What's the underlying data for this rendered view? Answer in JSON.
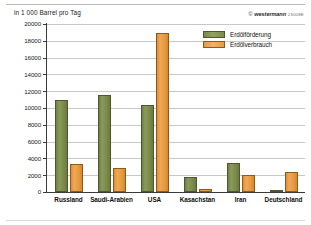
{
  "chart_data": {
    "type": "bar",
    "title": "in 1 000 Barrel pro Tag",
    "xlabel": "",
    "ylabel": "in 1 000 Barrel pro Tag",
    "ylim": [
      0,
      20000
    ],
    "ytick_step": 2000,
    "grid": true,
    "legend_position": "top-right",
    "categories": [
      "Russland",
      "Saudi-Arabien",
      "USA",
      "Kasachstan",
      "Iran",
      "Deutschland"
    ],
    "series": [
      {
        "name": "Erdölförderung",
        "color": "#7b8a4a",
        "values": [
          10900,
          11600,
          10300,
          1800,
          3500,
          150
        ]
      },
      {
        "name": "Erdölverbrauch",
        "color": "#e79a41",
        "values": [
          3300,
          2900,
          18900,
          300,
          2000,
          2400
        ]
      }
    ],
    "ytick_labels": [
      "0",
      "2000",
      "4000",
      "6000",
      "8000",
      "10000",
      "12000",
      "14000",
      "16000",
      "18000",
      "20000"
    ],
    "ytick_values": [
      0,
      2000,
      4000,
      6000,
      8000,
      10000,
      12000,
      14000,
      16000,
      18000,
      20000
    ]
  },
  "credit": {
    "copyright_mark": "©",
    "brand": "westermann",
    "code": "23008E"
  }
}
